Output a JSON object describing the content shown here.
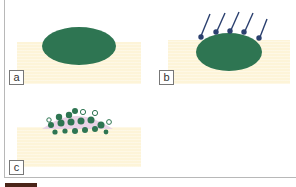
{
  "figure": {
    "panels": [
      {
        "label": "a",
        "description": "ellipse resting on substrate"
      },
      {
        "label": "b",
        "description": "ellipse in substrate with five pins/arrows pointing down toward it"
      },
      {
        "label": "c",
        "description": "cluster of small circles on substrate surface"
      }
    ],
    "colors": {
      "ellipse": "#2e7552",
      "substrate": "#fdf4d8",
      "pins": "#2a3f6e",
      "halo": "#e9d3e6",
      "frame": "#b8b8b8"
    }
  }
}
